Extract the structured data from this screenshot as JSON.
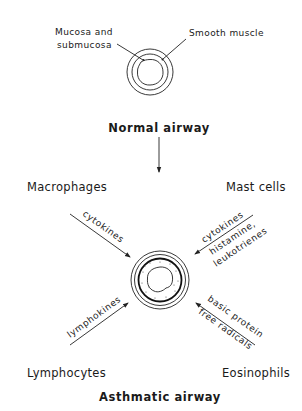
{
  "normal_airway": {
    "title": "Normal airway",
    "label_mucosa_line1": "Mucosa and",
    "label_mucosa_line2": "submucosa",
    "label_smooth_muscle": "Smooth muscle"
  },
  "asthmatic_airway": {
    "title": "Asthmatic airway"
  },
  "cells": {
    "macrophages": {
      "name": "Macrophages",
      "mediators": [
        "cytokines"
      ]
    },
    "mast_cells": {
      "name": "Mast cells",
      "mediators": [
        "cytokines",
        "histamine,",
        "leukotrienes"
      ]
    },
    "lymphocytes": {
      "name": "Lymphocytes",
      "mediators": [
        "lymphokines"
      ]
    },
    "eosinophils": {
      "name": "Eosinophils",
      "mediators": [
        "basic protein",
        "free radicals"
      ]
    }
  },
  "colors": {
    "ink": "#1a1a1a",
    "background": "#ffffff"
  }
}
